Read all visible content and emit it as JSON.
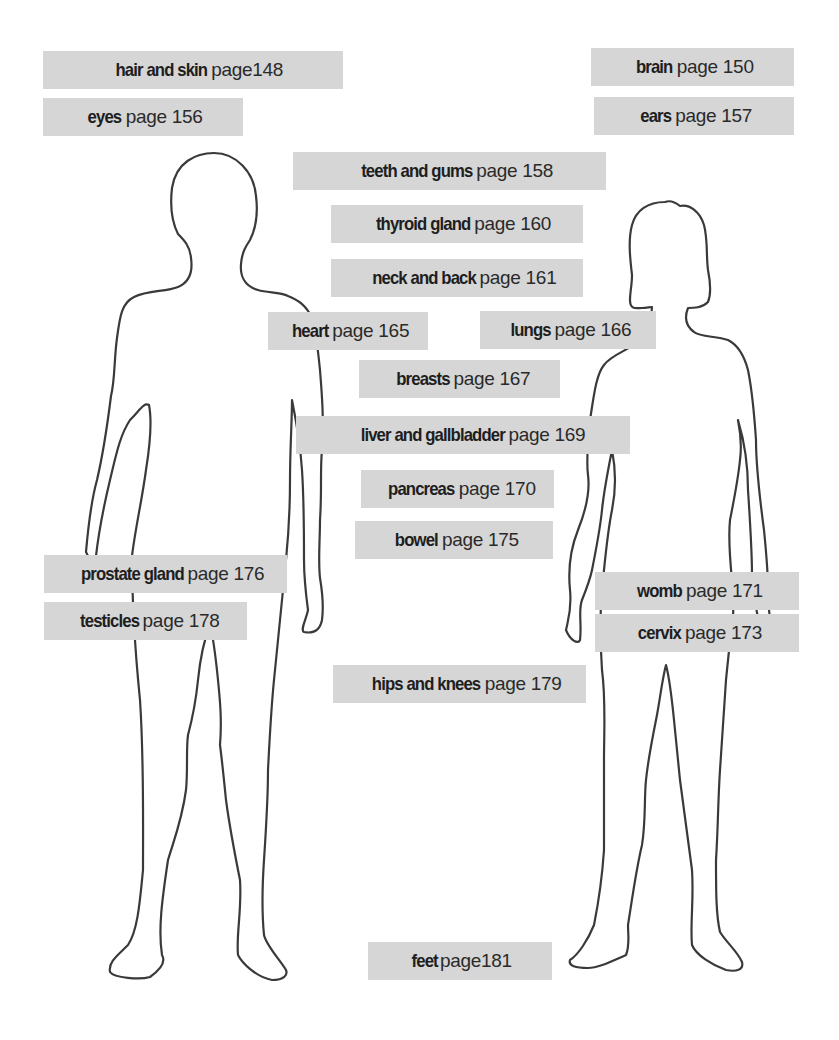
{
  "figures": {
    "male": "male-body-outline",
    "female": "female-body-outline"
  },
  "labels": [
    {
      "id": "hair-and-skin",
      "organ": "hair and skin",
      "page": "page148"
    },
    {
      "id": "eyes",
      "organ": "eyes",
      "page": "page 156"
    },
    {
      "id": "brain",
      "organ": "brain",
      "page": "page 150"
    },
    {
      "id": "ears",
      "organ": "ears",
      "page": "page 157"
    },
    {
      "id": "teeth-and-gums",
      "organ": "teeth and gums",
      "page": "page 158"
    },
    {
      "id": "thyroid-gland",
      "organ": "thyroid gland",
      "page": "page 160"
    },
    {
      "id": "neck-and-back",
      "organ": "neck and back",
      "page": "page 161"
    },
    {
      "id": "heart",
      "organ": "heart",
      "page": "page 165"
    },
    {
      "id": "lungs",
      "organ": "lungs",
      "page": "page 166"
    },
    {
      "id": "breasts",
      "organ": "breasts",
      "page": "page 167"
    },
    {
      "id": "liver-and-gallbladder",
      "organ": "liver and gallbladder",
      "page": "page 169"
    },
    {
      "id": "pancreas",
      "organ": "pancreas",
      "page": "page 170"
    },
    {
      "id": "bowel",
      "organ": "bowel",
      "page": "page 175"
    },
    {
      "id": "prostate-gland",
      "organ": "prostate gland",
      "page": "page 176"
    },
    {
      "id": "testicles",
      "organ": "testicles",
      "page": "page 178"
    },
    {
      "id": "womb",
      "organ": "womb",
      "page": "page 171"
    },
    {
      "id": "cervix",
      "organ": "cervix",
      "page": "page 173"
    },
    {
      "id": "hips-and-knees",
      "organ": "hips and knees",
      "page": "page 179"
    },
    {
      "id": "feet",
      "organ": "feet",
      "page": "page181"
    }
  ],
  "colors": {
    "label_bg": "#d6d6d6",
    "text": "#1e1e1e",
    "outline": "#3a3a3a",
    "background": "#ffffff"
  }
}
